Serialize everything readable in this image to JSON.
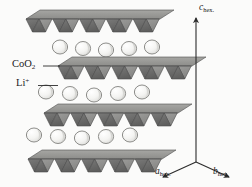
{
  "figure": {
    "kind": "crystal-structure-diagram",
    "material": "layered lithium cobalt oxide",
    "background_color": "#fbfbfa",
    "width": 252,
    "height": 187
  },
  "labels": {
    "coo2": {
      "base": "CoO",
      "subscript": "2",
      "leader": true
    },
    "lithium": {
      "base": "Li",
      "superscript": "+",
      "leader": true
    },
    "c_axis": {
      "base": "c",
      "subscript": "hex."
    },
    "a_axis": {
      "base": "a",
      "subscript": "hex."
    },
    "b_axis": {
      "base": "b",
      "subscript": "hex."
    }
  },
  "colors": {
    "slab_top_face": "#9a9a98",
    "slab_triangle_dark": "#6e6e6e",
    "slab_triangle_light": "#8f8f8d",
    "slab_edge": "#4a4a4a",
    "sphere_fill": "#f2f2f0",
    "sphere_shade": "#c9c9c6",
    "sphere_outline": "#8a8a88",
    "axis_line": "#2b2b2b",
    "leader_line": "#2b2b2b",
    "text": "#1a1a1a"
  },
  "structure": {
    "description": "Four CoO2 octahedral slabs alternating with three layers of Li+ ions, viewed nearly edge-on with hexagonal axes",
    "slab_count": 4,
    "li_layer_count": 3,
    "octahedra_per_slab": 5,
    "li_ions_per_layer": 5,
    "slabs": [
      {
        "id": "slab-1",
        "x": 26,
        "y": 10,
        "octahedra": 5
      },
      {
        "id": "slab-2",
        "x": 58,
        "y": 57,
        "octahedra": 5
      },
      {
        "id": "slab-3",
        "x": 44,
        "y": 104,
        "octahedra": 5
      },
      {
        "id": "slab-4",
        "x": 28,
        "y": 150,
        "octahedra": 5
      }
    ],
    "li_layers": [
      {
        "id": "li-layer-1",
        "x": 52,
        "y": 40,
        "count": 5
      },
      {
        "id": "li-layer-2",
        "x": 38,
        "y": 85,
        "count": 5
      },
      {
        "id": "li-layer-3",
        "x": 26,
        "y": 128,
        "count": 5
      }
    ]
  },
  "axes": {
    "origin": {
      "x": 196,
      "y": 162
    },
    "c": {
      "tip_x": 196,
      "tip_y": 16
    },
    "a": {
      "tip_x": 161,
      "tip_y": 178
    },
    "b": {
      "tip_x": 231,
      "tip_y": 178
    }
  }
}
